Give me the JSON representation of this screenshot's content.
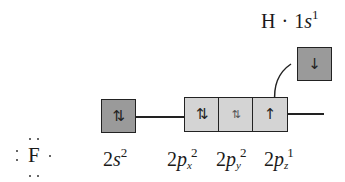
{
  "diagram": {
    "type": "orbital-box-diagram",
    "colors": {
      "dark_box": "#9a9a9a",
      "light_box": "#d4d4d4",
      "stroke": "#222222",
      "background": "#ffffff"
    },
    "hydrogen": {
      "label_symbol": "H",
      "label_dot": "·",
      "label_orbital": "1",
      "label_orbital_letter": "s",
      "label_superscript": "1",
      "box": {
        "electrons": "↓"
      }
    },
    "fluorine": {
      "symbol": "F",
      "lewis_dots": {
        "top": 2,
        "left": 2,
        "right": 1,
        "bottom": 2
      },
      "orbitals": [
        {
          "name": "2s",
          "label_n": "2",
          "label_letter": "s",
          "label_sub": "",
          "label_sup": "2",
          "electrons": "⇅"
        },
        {
          "name": "2px",
          "label_n": "2",
          "label_letter": "p",
          "label_sub": "x",
          "label_sup": "2",
          "electrons": "⇅"
        },
        {
          "name": "2py",
          "label_n": "2",
          "label_letter": "p",
          "label_sub": "y",
          "label_sup": "2",
          "electrons": "⇅"
        },
        {
          "name": "2pz",
          "label_n": "2",
          "label_letter": "p",
          "label_sub": "z",
          "label_sup": "1",
          "electrons": "↑"
        }
      ]
    },
    "arrow": {
      "from": "hydrogen-1s-box",
      "to": "fluorine-2pz-box",
      "style": "curved"
    }
  }
}
